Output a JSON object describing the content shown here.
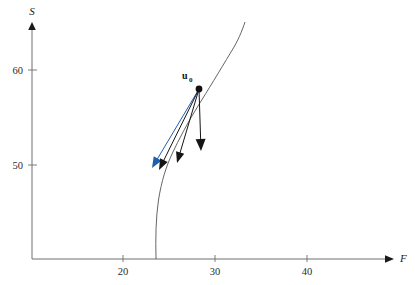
{
  "figure": {
    "title": "",
    "background_color": "#ffffff"
  },
  "axes": {
    "x": {
      "label": "F",
      "ticks": [
        {
          "value": 20,
          "label": "20",
          "px": 123
        },
        {
          "value": 30,
          "label": "30",
          "px": 215
        },
        {
          "value": 40,
          "label": "40",
          "px": 307
        }
      ],
      "axis_line_y_px": 259,
      "origin_px": 32,
      "arrow": true,
      "color": "#6e6e6e"
    },
    "y": {
      "label": "S",
      "ticks": [
        {
          "value": 50,
          "label": "50",
          "px": 165
        },
        {
          "value": 60,
          "label": "60",
          "px": 70
        }
      ],
      "axis_line_x_px": 32,
      "arrow": true,
      "color": "#6e6e6e"
    }
  },
  "curve": {
    "name": "nullcline",
    "color": "#55534f",
    "stroke_width": 0.9,
    "path": "M 156,259 C 155.5,238 155.8,218 158.5,200 C 161.5,181 166,167 172,154 C 179,139 188,122 198,106 C 208,90 219,72 231,52 C 238,41 242,31 245,22"
  },
  "point": {
    "name": "u0",
    "label_main": "u",
    "label_sub": "0",
    "x_value": 28.3,
    "y_value": 57.5,
    "px": {
      "x": 199,
      "y": 89
    },
    "radius": 3.4,
    "color": "#111111"
  },
  "vectors": [
    {
      "name": "vector-blue",
      "color": "#1f5fae",
      "from_px": {
        "x": 199,
        "y": 89
      },
      "to_px": {
        "x": 152,
        "y": 168
      },
      "head_length": 11,
      "head_width": 9
    },
    {
      "name": "vector-black-long",
      "color": "#151515",
      "from_px": {
        "x": 199,
        "y": 89
      },
      "to_px": {
        "x": 159,
        "y": 170
      },
      "head_length": 11,
      "head_width": 8.5
    },
    {
      "name": "vector-black-mid",
      "color": "#151515",
      "from_px": {
        "x": 199,
        "y": 89
      },
      "to_px": {
        "x": 177,
        "y": 163
      },
      "head_length": 11,
      "head_width": 8.5
    },
    {
      "name": "vector-black-vertical",
      "color": "#151515",
      "from_px": {
        "x": 199,
        "y": 89
      },
      "to_px": {
        "x": 201,
        "y": 151
      },
      "head_length": 12,
      "head_width": 10
    }
  ],
  "chart_data": {
    "type": "line",
    "title": "",
    "xlabel": "F",
    "ylabel": "S",
    "xlim": [
      12,
      44
    ],
    "ylim": [
      28,
      70
    ],
    "grid": false,
    "legend": null,
    "x_ticks": [
      20,
      30,
      40
    ],
    "y_ticks": [
      50,
      60
    ],
    "series": [
      {
        "name": "nullcline",
        "color": "#55534f",
        "x": [
          23.5,
          23.4,
          23.5,
          23.8,
          24.2,
          24.8,
          25.5,
          26.5,
          27.6,
          28.7,
          30.0,
          31.3,
          32.5,
          33.5
        ],
        "y": [
          28.0,
          30.5,
          33.0,
          36.0,
          39.0,
          42.0,
          45.0,
          48.5,
          52.0,
          55.5,
          59.5,
          63.0,
          66.0,
          68.5
        ]
      }
    ],
    "annotations": [
      {
        "type": "point",
        "label": "u_0",
        "x": 28.3,
        "y": 57.5,
        "marker": "filled-circle",
        "color": "#111111"
      },
      {
        "type": "arrow",
        "label": "vector-blue",
        "from": [
          28.3,
          57.5
        ],
        "to": [
          23.2,
          50.0
        ],
        "color": "#1f5fae"
      },
      {
        "type": "arrow",
        "label": "vector-black-long",
        "from": [
          28.3,
          57.5
        ],
        "to": [
          23.9,
          49.8
        ],
        "color": "#151515"
      },
      {
        "type": "arrow",
        "label": "vector-black-mid",
        "from": [
          28.3,
          57.5
        ],
        "to": [
          25.8,
          50.5
        ],
        "color": "#151515"
      },
      {
        "type": "arrow",
        "label": "vector-black-vertical",
        "from": [
          28.3,
          57.5
        ],
        "to": [
          28.5,
          51.7
        ],
        "color": "#151515"
      }
    ]
  }
}
